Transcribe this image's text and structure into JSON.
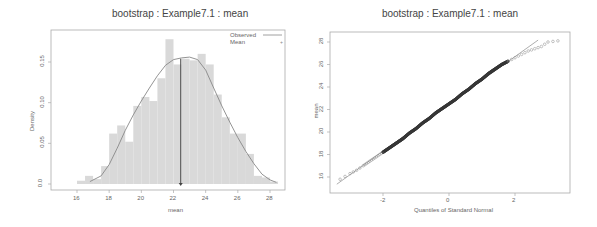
{
  "chart_data": [
    {
      "type": "bar",
      "subtype": "histogram_with_density",
      "title": "bootstrap : Example7.1 : mean",
      "xlabel": "mean",
      "ylabel": "Density",
      "xlim": [
        16.5,
        28.7
      ],
      "ylim": [
        0,
        0.185
      ],
      "xticks": [
        "16",
        "18",
        "20",
        "22",
        "24",
        "26",
        "28"
      ],
      "yticks": [
        "0.0",
        "0.05",
        "0.10",
        "0.15"
      ],
      "legend": [
        {
          "label": "Observed",
          "symbol": "line"
        },
        {
          "label": "Mean",
          "symbol": "point"
        }
      ],
      "bin_width": 0.5,
      "bins": [
        {
          "x0": 16.0,
          "x1": 16.5,
          "density": 0.004
        },
        {
          "x0": 16.5,
          "x1": 17.0,
          "density": 0.01
        },
        {
          "x0": 17.0,
          "x1": 17.5,
          "density": 0.006
        },
        {
          "x0": 17.5,
          "x1": 18.0,
          "density": 0.022
        },
        {
          "x0": 18.0,
          "x1": 18.5,
          "density": 0.062
        },
        {
          "x0": 18.5,
          "x1": 19.0,
          "density": 0.072
        },
        {
          "x0": 19.0,
          "x1": 19.5,
          "density": 0.052
        },
        {
          "x0": 19.5,
          "x1": 20.0,
          "density": 0.096
        },
        {
          "x0": 20.0,
          "x1": 20.5,
          "density": 0.107
        },
        {
          "x0": 20.5,
          "x1": 21.0,
          "density": 0.102
        },
        {
          "x0": 21.0,
          "x1": 21.5,
          "density": 0.13
        },
        {
          "x0": 21.5,
          "x1": 22.0,
          "density": 0.178
        },
        {
          "x0": 22.0,
          "x1": 22.5,
          "density": 0.147
        },
        {
          "x0": 22.5,
          "x1": 23.0,
          "density": 0.154
        },
        {
          "x0": 23.0,
          "x1": 23.5,
          "density": 0.152
        },
        {
          "x0": 23.5,
          "x1": 24.0,
          "density": 0.16
        },
        {
          "x0": 24.0,
          "x1": 24.5,
          "density": 0.147
        },
        {
          "x0": 24.5,
          "x1": 25.0,
          "density": 0.11
        },
        {
          "x0": 25.0,
          "x1": 25.5,
          "density": 0.082
        },
        {
          "x0": 25.5,
          "x1": 26.0,
          "density": 0.062
        },
        {
          "x0": 26.0,
          "x1": 26.5,
          "density": 0.062
        },
        {
          "x0": 26.5,
          "x1": 27.0,
          "density": 0.037
        },
        {
          "x0": 27.0,
          "x1": 27.5,
          "density": 0.01
        },
        {
          "x0": 27.5,
          "x1": 28.0,
          "density": 0.008
        },
        {
          "x0": 28.0,
          "x1": 28.5,
          "density": 0.003
        }
      ],
      "density_curve": {
        "x": [
          16.8,
          17.5,
          18.0,
          18.5,
          19.0,
          19.5,
          20.0,
          20.5,
          21.0,
          21.5,
          22.0,
          22.5,
          23.0,
          23.5,
          24.0,
          24.5,
          25.0,
          25.5,
          26.0,
          26.5,
          27.0,
          27.5,
          28.0,
          28.4
        ],
        "y": [
          0.003,
          0.01,
          0.024,
          0.044,
          0.066,
          0.085,
          0.102,
          0.118,
          0.133,
          0.146,
          0.153,
          0.155,
          0.156,
          0.153,
          0.14,
          0.118,
          0.096,
          0.076,
          0.057,
          0.04,
          0.025,
          0.012,
          0.005,
          0.002
        ]
      },
      "mean_line": {
        "x": 22.45,
        "label": "Mean"
      }
    },
    {
      "type": "scatter",
      "subtype": "qq_plot",
      "title": "bootstrap : Example7.1 : mean",
      "xlabel": "Quantiles of Standard Normal",
      "ylabel": "mean",
      "xlim": [
        -3.4,
        3.5
      ],
      "ylim": [
        15.2,
        28.8
      ],
      "xticks": [
        "-2",
        "0",
        "2"
      ],
      "yticks": [
        "16",
        "18",
        "20",
        "22",
        "24",
        "26",
        "28"
      ],
      "reference_line": {
        "intercept": 22.5,
        "slope": 2.1
      },
      "points": [
        [
          -3.3,
          15.8
        ],
        [
          -3.0,
          16.3
        ],
        [
          -2.8,
          16.6
        ],
        [
          -2.6,
          17.0
        ],
        [
          -2.5,
          17.2
        ],
        [
          -2.4,
          17.4
        ],
        [
          -2.3,
          17.6
        ],
        [
          -2.2,
          17.8
        ],
        [
          -2.1,
          18.0
        ],
        [
          -2.0,
          18.2
        ],
        [
          -1.8,
          18.6
        ],
        [
          -1.6,
          19.0
        ],
        [
          -1.4,
          19.4
        ],
        [
          -1.2,
          19.9
        ],
        [
          -1.0,
          20.3
        ],
        [
          -0.8,
          20.8
        ],
        [
          -0.6,
          21.2
        ],
        [
          -0.4,
          21.7
        ],
        [
          -0.2,
          22.1
        ],
        [
          0.0,
          22.5
        ],
        [
          0.2,
          22.9
        ],
        [
          0.4,
          23.4
        ],
        [
          0.6,
          23.8
        ],
        [
          0.8,
          24.3
        ],
        [
          1.0,
          24.7
        ],
        [
          1.2,
          25.2
        ],
        [
          1.4,
          25.6
        ],
        [
          1.6,
          26.0
        ],
        [
          1.8,
          26.3
        ],
        [
          2.0,
          26.6
        ],
        [
          2.2,
          26.9
        ],
        [
          2.4,
          27.2
        ],
        [
          2.6,
          27.4
        ],
        [
          2.8,
          27.6
        ],
        [
          3.0,
          28.0
        ],
        [
          3.3,
          28.1
        ]
      ]
    }
  ],
  "panels": {
    "left": {
      "title": "bootstrap : Example7.1 : mean",
      "xlabel": "mean",
      "ylabel": "Density",
      "legend_observed": "Observed",
      "legend_mean": "Mean"
    },
    "right": {
      "title": "bootstrap : Example7.1 : mean",
      "xlabel": "Quantiles of Standard Normal",
      "ylabel": "mean"
    }
  },
  "colors": {
    "bar_fill": "#d9d9d9",
    "curve": "#888888",
    "mean_line": "#444444",
    "axis": "#aaaaaa",
    "points": "#333333"
  }
}
